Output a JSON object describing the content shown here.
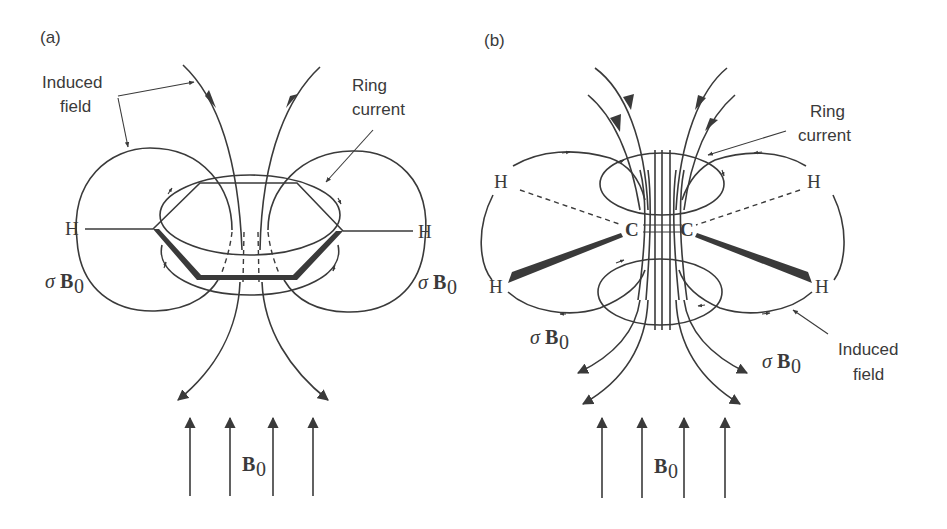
{
  "figure": {
    "panels": [
      {
        "id": "a",
        "label": "(a)",
        "molecule": "benzene",
        "annotations": {
          "induced_field": [
            "Induced",
            "field"
          ],
          "ring_current": [
            "Ring",
            "current"
          ]
        },
        "atoms": [
          "H",
          "H"
        ],
        "shielding": {
          "sigma": "σ",
          "B": "B",
          "sub": "0"
        },
        "applied_field": {
          "B": "B",
          "sub": "0"
        }
      },
      {
        "id": "b",
        "label": "(b)",
        "molecule": "acetylene-like (C≡C with H substituents)",
        "annotations": {
          "ring_current": [
            "Ring",
            "current"
          ],
          "induced_field": [
            "Induced",
            "field"
          ]
        },
        "atoms": [
          "H",
          "H",
          "H",
          "H",
          "C",
          "C"
        ],
        "shielding": {
          "sigma": "σ",
          "B": "B",
          "sub": "0"
        },
        "applied_field": {
          "B": "B",
          "sub": "0"
        }
      }
    ],
    "colors": {
      "ink": "#3a3a3a",
      "background": "#ffffff"
    }
  }
}
